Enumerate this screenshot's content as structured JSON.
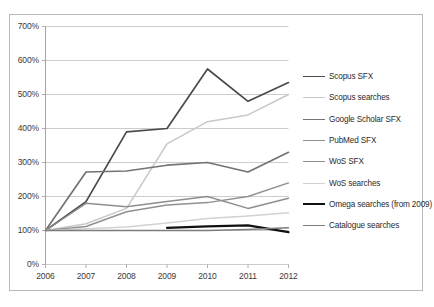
{
  "chart_data": {
    "type": "line",
    "title": "",
    "subtitle": "",
    "xlabel": "",
    "ylabel": "",
    "x": [
      2006,
      2007,
      2008,
      2009,
      2010,
      2011,
      2012
    ],
    "xticklabels": [
      "2006",
      "2007",
      "2008",
      "2009",
      "2010",
      "2011",
      "2012"
    ],
    "yticklabels": [
      "0%",
      "100%",
      "200%",
      "300%",
      "400%",
      "500%",
      "600%",
      "700%"
    ],
    "ytickvalues": [
      0,
      100,
      200,
      300,
      400,
      500,
      600,
      700
    ],
    "ylim": [
      0,
      700
    ],
    "xlim": [
      2006,
      2012
    ],
    "grid": "horizontal",
    "legend_position": "right",
    "series": [
      {
        "name": "Scopus SFX",
        "color": "#4a4a4a",
        "width": 1.7,
        "values": [
          100,
          185,
          390,
          400,
          575,
          480,
          535
        ]
      },
      {
        "name": "Scopus searches",
        "color": "#c8c8c8",
        "width": 1.5,
        "values": [
          100,
          120,
          165,
          355,
          420,
          440,
          500
        ]
      },
      {
        "name": "Google Scholar SFX",
        "color": "#737373",
        "width": 1.7,
        "values": [
          100,
          272,
          275,
          292,
          300,
          272,
          330
        ]
      },
      {
        "name": "PubMed SFX",
        "color": "#8e8e8e",
        "width": 1.5,
        "values": [
          100,
          180,
          170,
          185,
          200,
          165,
          195
        ]
      },
      {
        "name": "WoS SFX",
        "color": "#909090",
        "width": 1.5,
        "values": [
          100,
          112,
          155,
          175,
          182,
          200,
          240
        ]
      },
      {
        "name": "WoS searches",
        "color": "#d2d2d2",
        "width": 1.5,
        "values": [
          100,
          105,
          110,
          122,
          135,
          143,
          152
        ]
      },
      {
        "name": "Omega searches (from 2009)",
        "color": "#111111",
        "width": 2.2,
        "values": [
          null,
          null,
          null,
          108,
          112,
          115,
          95
        ]
      },
      {
        "name": "Catalogue searches",
        "color": "#7c7c7c",
        "width": 1.5,
        "values": [
          100,
          100,
          100,
          100,
          100,
          103,
          108
        ]
      }
    ]
  },
  "axes": {
    "grid_color": "#bfbfbf",
    "axis_color": "#9a9a9a",
    "frame_color": "#b9b9b9",
    "background": "#ffffff"
  }
}
